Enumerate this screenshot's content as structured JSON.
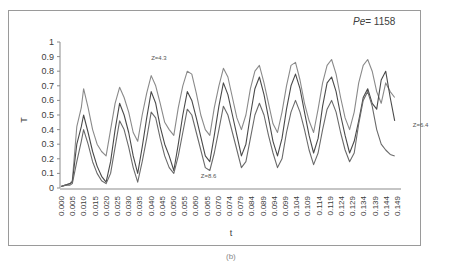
{
  "chart_data": {
    "type": "line",
    "title": "",
    "annotation_top_right": {
      "italic": "Pe",
      "text": "= 1158"
    },
    "xlabel": "t",
    "ylabel": "T",
    "ylim": [
      0,
      1
    ],
    "yticks": [
      "0",
      "0.1",
      "0.2",
      "0.3",
      "0.4",
      "0.5",
      "0.6",
      "0.7",
      "0.8",
      "0.9",
      "1"
    ],
    "xticks": [
      "0.000",
      "0.005",
      "0.010",
      "0.015",
      "0.020",
      "0.025",
      "0.030",
      "0.035",
      "0.040",
      "0.045",
      "0.050",
      "0.055",
      "0.060",
      "0.065",
      "0.070",
      "0.074",
      "0.079",
      "0.084",
      "0.089",
      "0.094",
      "0.099",
      "0.104",
      "0.109",
      "0.114",
      "0.119",
      "0.124",
      "0.129",
      "0.134",
      "0.139",
      "0.144",
      "0.149"
    ],
    "grid": false,
    "legend": "inline annotations",
    "x": [
      0.0,
      0.002,
      0.004,
      0.005,
      0.007,
      0.009,
      0.01,
      0.012,
      0.014,
      0.016,
      0.018,
      0.02,
      0.022,
      0.024,
      0.026,
      0.028,
      0.03,
      0.032,
      0.034,
      0.036,
      0.038,
      0.04,
      0.042,
      0.044,
      0.046,
      0.048,
      0.05,
      0.052,
      0.054,
      0.056,
      0.058,
      0.06,
      0.062,
      0.064,
      0.066,
      0.068,
      0.07,
      0.072,
      0.074,
      0.076,
      0.078,
      0.08,
      0.082,
      0.084,
      0.086,
      0.088,
      0.09,
      0.092,
      0.094,
      0.096,
      0.098,
      0.1,
      0.102,
      0.104,
      0.106,
      0.108,
      0.11,
      0.112,
      0.114,
      0.116,
      0.118,
      0.12,
      0.122,
      0.124,
      0.126,
      0.128,
      0.13,
      0.132,
      0.134,
      0.136,
      0.138,
      0.14,
      0.142,
      0.144,
      0.146,
      0.148
    ],
    "series": [
      {
        "name": "Z=4.3",
        "color": "#8a8a8a",
        "values": [
          0.01,
          0.02,
          0.03,
          0.05,
          0.42,
          0.55,
          0.68,
          0.55,
          0.4,
          0.3,
          0.25,
          0.22,
          0.4,
          0.58,
          0.69,
          0.62,
          0.52,
          0.38,
          0.32,
          0.5,
          0.65,
          0.77,
          0.7,
          0.58,
          0.45,
          0.4,
          0.36,
          0.55,
          0.7,
          0.8,
          0.78,
          0.65,
          0.5,
          0.4,
          0.36,
          0.55,
          0.7,
          0.82,
          0.76,
          0.62,
          0.48,
          0.4,
          0.5,
          0.68,
          0.8,
          0.84,
          0.72,
          0.58,
          0.44,
          0.38,
          0.52,
          0.7,
          0.84,
          0.86,
          0.74,
          0.58,
          0.46,
          0.38,
          0.54,
          0.72,
          0.84,
          0.88,
          0.78,
          0.62,
          0.48,
          0.4,
          0.52,
          0.72,
          0.84,
          0.88,
          0.8,
          0.66,
          0.58,
          0.72,
          0.66,
          0.62
        ]
      },
      {
        "name": "Z=6.4",
        "color": "#4a4a4a",
        "values": [
          0.01,
          0.02,
          0.03,
          0.04,
          0.3,
          0.42,
          0.5,
          0.38,
          0.25,
          0.15,
          0.08,
          0.04,
          0.18,
          0.4,
          0.58,
          0.5,
          0.38,
          0.22,
          0.1,
          0.28,
          0.48,
          0.66,
          0.58,
          0.42,
          0.3,
          0.22,
          0.12,
          0.3,
          0.5,
          0.66,
          0.6,
          0.48,
          0.35,
          0.22,
          0.18,
          0.36,
          0.56,
          0.72,
          0.64,
          0.5,
          0.36,
          0.22,
          0.3,
          0.5,
          0.68,
          0.76,
          0.64,
          0.48,
          0.32,
          0.22,
          0.34,
          0.54,
          0.7,
          0.78,
          0.68,
          0.52,
          0.36,
          0.24,
          0.34,
          0.56,
          0.72,
          0.76,
          0.66,
          0.5,
          0.36,
          0.24,
          0.32,
          0.46,
          0.62,
          0.68,
          0.58,
          0.54,
          0.74,
          0.8,
          0.62,
          0.46
        ]
      },
      {
        "name": "Z=8.6",
        "color": "#6a6a6a",
        "values": [
          0.01,
          0.02,
          0.02,
          0.03,
          0.18,
          0.32,
          0.4,
          0.3,
          0.18,
          0.1,
          0.05,
          0.03,
          0.1,
          0.28,
          0.46,
          0.4,
          0.28,
          0.14,
          0.04,
          0.18,
          0.34,
          0.52,
          0.48,
          0.34,
          0.22,
          0.14,
          0.1,
          0.22,
          0.38,
          0.54,
          0.5,
          0.38,
          0.26,
          0.14,
          0.12,
          0.24,
          0.4,
          0.56,
          0.5,
          0.38,
          0.26,
          0.14,
          0.18,
          0.34,
          0.5,
          0.58,
          0.5,
          0.36,
          0.24,
          0.14,
          0.2,
          0.38,
          0.52,
          0.6,
          0.52,
          0.4,
          0.26,
          0.16,
          0.24,
          0.4,
          0.54,
          0.6,
          0.52,
          0.38,
          0.26,
          0.18,
          0.24,
          0.44,
          0.6,
          0.66,
          0.56,
          0.4,
          0.3,
          0.26,
          0.23,
          0.22
        ]
      }
    ],
    "annotations": [
      {
        "text": "Z=4.3",
        "x": 0.04,
        "y": 0.88
      },
      {
        "text": "Z=8.6",
        "x": 0.062,
        "y": 0.07
      },
      {
        "text": "Z=6.4",
        "x": 0.156,
        "y": 0.42
      }
    ],
    "caption": "(b)"
  }
}
